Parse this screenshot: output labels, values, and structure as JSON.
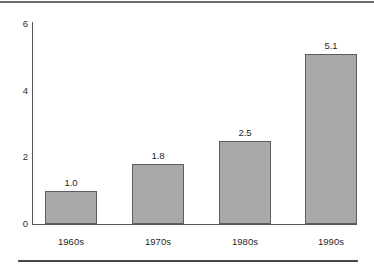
{
  "chart_data": {
    "type": "bar",
    "title": "",
    "subtitle": "",
    "xlabel": "",
    "ylabel": "",
    "categories": [
      "1960s",
      "1970s",
      "1980s",
      "1990s"
    ],
    "values": [
      1.0,
      1.8,
      2.5,
      5.1
    ],
    "value_labels": [
      "1.0",
      "1.8",
      "2.5",
      "5.1"
    ],
    "ylim": [
      0,
      6
    ],
    "yticks": [
      0,
      2,
      4,
      6
    ],
    "ytick_labels": [
      "0",
      "2",
      "4",
      "6"
    ],
    "grid": false,
    "legend": null,
    "bar_fill_color": "#a9a9a9",
    "bar_border_color": "#5d5d60",
    "axis_color": "#55555a",
    "text_color": "#1f1f1f",
    "background_color": "#ffffff"
  },
  "decorations": {
    "top_rule_color": "#6e6e72",
    "bottom_rule_color": "#4a4a4e"
  }
}
